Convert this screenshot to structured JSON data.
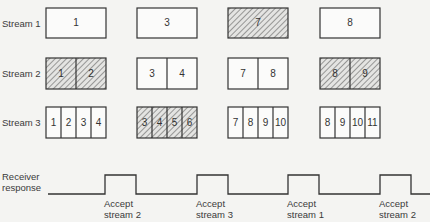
{
  "streams": [
    {
      "label": "Stream 1",
      "groups": [
        {
          "cells": [
            "1"
          ],
          "hatched": false
        },
        {
          "cells": [
            "3"
          ],
          "hatched": false
        },
        {
          "cells": [
            "7"
          ],
          "hatched": true
        },
        {
          "cells": [
            "8"
          ],
          "hatched": false
        }
      ]
    },
    {
      "label": "Stream 2",
      "groups": [
        {
          "cells": [
            "1",
            "2"
          ],
          "hatched": true
        },
        {
          "cells": [
            "3",
            "4"
          ],
          "hatched": false
        },
        {
          "cells": [
            "7",
            "8"
          ],
          "hatched": false
        },
        {
          "cells": [
            "8",
            "9"
          ],
          "hatched": true
        }
      ]
    },
    {
      "label": "Stream 3",
      "groups": [
        {
          "cells": [
            "1",
            "2",
            "3",
            "4"
          ],
          "hatched": false
        },
        {
          "cells": [
            "3",
            "4",
            "5",
            "6"
          ],
          "hatched": true
        },
        {
          "cells": [
            "7",
            "8",
            "9",
            "10"
          ],
          "hatched": false
        },
        {
          "cells": [
            "8",
            "9",
            "10",
            "11"
          ],
          "hatched": false
        }
      ]
    }
  ],
  "receiver": {
    "label_line1": "Receiver",
    "label_line2": "response",
    "pulses": [
      {
        "line1": "Accept",
        "line2": "stream 2"
      },
      {
        "line1": "Accept",
        "line2": "stream 3"
      },
      {
        "line1": "Accept",
        "line2": "stream 1"
      },
      {
        "line1": "Accept",
        "line2": "stream 2"
      }
    ]
  }
}
